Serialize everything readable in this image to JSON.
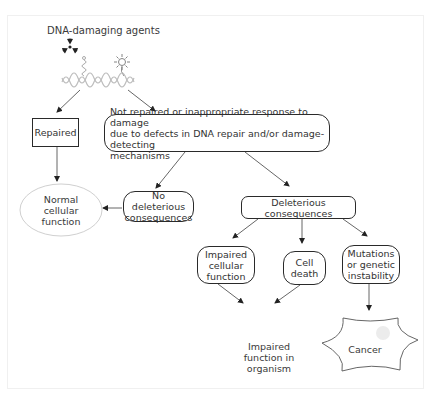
{
  "diagram": {
    "title": "DNA-damaging agents",
    "icons": {
      "radiation": "radiation-icon",
      "chemical": "chemical-agent-icon",
      "uv": "sun-uv-icon",
      "dna": "dna-helix-icon"
    },
    "nodes": {
      "repaired": "Repaired",
      "not_repaired_line1": "Not repaired or inappropriate response to damage",
      "not_repaired_line2": "due to defects in DNA repair and/or damage-detecting",
      "not_repaired_line3": "mechanisms",
      "normal_line1": "Normal",
      "normal_line2": "cellular",
      "normal_line3": "function",
      "no_deleterious_line1": "No deleterious",
      "no_deleterious_line2": "consequences",
      "deleterious": "Deleterious consequences",
      "impaired_cellular_line1": "Impaired",
      "impaired_cellular_line2": "cellular",
      "impaired_cellular_line3": "function",
      "cell_death_line1": "Cell",
      "cell_death_line2": "death",
      "mutations_line1": "Mutations",
      "mutations_line2": "or genetic",
      "mutations_line3": "instability",
      "organism_line1": "Impaired",
      "organism_line2": "function in",
      "organism_line3": "organism",
      "cancer": "Cancer"
    },
    "edges": [
      {
        "from": "dna-damaging-agents",
        "to": "repaired"
      },
      {
        "from": "dna-damaging-agents",
        "to": "not-repaired"
      },
      {
        "from": "repaired",
        "to": "normal-cellular-function"
      },
      {
        "from": "not-repaired",
        "to": "no-deleterious-consequences"
      },
      {
        "from": "not-repaired",
        "to": "deleterious-consequences"
      },
      {
        "from": "no-deleterious-consequences",
        "to": "normal-cellular-function"
      },
      {
        "from": "deleterious-consequences",
        "to": "impaired-cellular-function"
      },
      {
        "from": "deleterious-consequences",
        "to": "cell-death"
      },
      {
        "from": "deleterious-consequences",
        "to": "mutations-genetic-instability"
      },
      {
        "from": "impaired-cellular-function",
        "to": "impaired-function-organism"
      },
      {
        "from": "cell-death",
        "to": "impaired-function-organism"
      },
      {
        "from": "mutations-genetic-instability",
        "to": "cancer"
      }
    ],
    "colors": {
      "stroke": "#2a2a2a",
      "text": "#333333",
      "ellipse_stroke": "#cfcfcf",
      "helix": "#bdbdbd"
    }
  }
}
